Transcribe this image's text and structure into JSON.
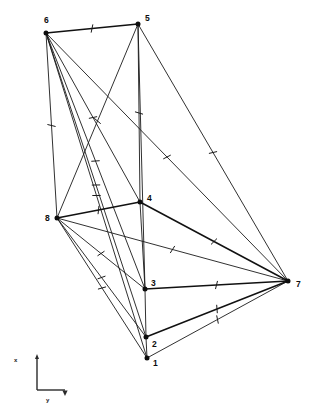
{
  "figure": {
    "type": "node-link-diagram",
    "background_color": "#ffffff",
    "line_color": "#1a1a1a",
    "node_color": "#0d0d0d",
    "nodes": [
      {
        "id": "1",
        "label": "1",
        "x": 147,
        "y": 358,
        "label_x": 153,
        "label_y": 366
      },
      {
        "id": "2",
        "label": "2",
        "x": 146,
        "y": 337,
        "label_x": 152,
        "label_y": 347
      },
      {
        "id": "3",
        "label": "3",
        "x": 145,
        "y": 289,
        "label_x": 151,
        "label_y": 286
      },
      {
        "id": "4",
        "label": "4",
        "x": 140,
        "y": 202,
        "label_x": 147,
        "label_y": 201
      },
      {
        "id": "5",
        "label": "5",
        "x": 138,
        "y": 24,
        "label_x": 145,
        "label_y": 21
      },
      {
        "id": "6",
        "label": "6",
        "x": 46,
        "y": 33,
        "label_x": 44,
        "label_y": 23
      },
      {
        "id": "7",
        "label": "7",
        "x": 288,
        "y": 281,
        "label_x": 296,
        "label_y": 287
      },
      {
        "id": "8",
        "label": "8",
        "x": 57,
        "y": 218,
        "label_x": 45,
        "label_y": 221
      }
    ],
    "edges": [
      {
        "from": "6",
        "to": "5",
        "weight": "heavy",
        "ticks": 1
      },
      {
        "from": "6",
        "to": "8",
        "weight": "normal",
        "ticks": 1
      },
      {
        "from": "6",
        "to": "4",
        "weight": "normal",
        "ticks": 1
      },
      {
        "from": "6",
        "to": "3",
        "weight": "normal",
        "ticks": 1
      },
      {
        "from": "6",
        "to": "2",
        "weight": "normal",
        "ticks": 1
      },
      {
        "from": "6",
        "to": "1",
        "weight": "normal",
        "ticks": 1
      },
      {
        "from": "6",
        "to": "7",
        "weight": "normal",
        "ticks": 1
      },
      {
        "from": "5",
        "to": "4",
        "weight": "normal",
        "ticks": 1
      },
      {
        "from": "5",
        "to": "3",
        "weight": "normal",
        "ticks": 0
      },
      {
        "from": "5",
        "to": "8",
        "weight": "normal",
        "ticks": 1
      },
      {
        "from": "5",
        "to": "7",
        "weight": "normal",
        "ticks": 1
      },
      {
        "from": "8",
        "to": "4",
        "weight": "heavy",
        "ticks": 1
      },
      {
        "from": "8",
        "to": "3",
        "weight": "normal",
        "ticks": 1
      },
      {
        "from": "8",
        "to": "2",
        "weight": "normal",
        "ticks": 1
      },
      {
        "from": "8",
        "to": "1",
        "weight": "normal",
        "ticks": 1
      },
      {
        "from": "8",
        "to": "7",
        "weight": "normal",
        "ticks": 1
      },
      {
        "from": "4",
        "to": "3",
        "weight": "normal",
        "ticks": 0
      },
      {
        "from": "4",
        "to": "7",
        "weight": "heavy",
        "ticks": 1
      },
      {
        "from": "3",
        "to": "2",
        "weight": "normal",
        "ticks": 0
      },
      {
        "from": "3",
        "to": "7",
        "weight": "heavy",
        "ticks": 1
      },
      {
        "from": "2",
        "to": "1",
        "weight": "normal",
        "ticks": 0
      },
      {
        "from": "2",
        "to": "7",
        "weight": "heavy",
        "ticks": 1
      },
      {
        "from": "1",
        "to": "7",
        "weight": "normal",
        "ticks": 1
      }
    ]
  },
  "axis_indicator": {
    "x_label": "x",
    "y_label": "y",
    "corner_x": 37,
    "corner_y": 390,
    "top_y": 357,
    "right_x": 65,
    "x_label_x": 14,
    "x_label_y": 362,
    "y_label_x": 46,
    "y_label_y": 402
  }
}
